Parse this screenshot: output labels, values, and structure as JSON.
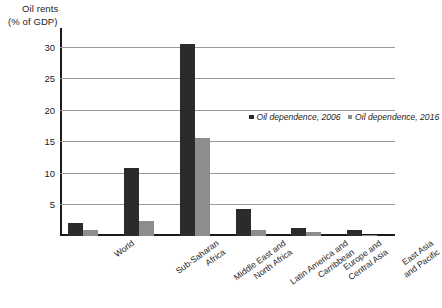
{
  "chart_data": {
    "type": "bar",
    "title": "Oil rents (% of GDP)",
    "title_line1": "Oil rents",
    "title_line2": "(% of GDP)",
    "xlabel": "",
    "ylabel": "Oil rents (% of GDP)",
    "ylim": [
      0,
      33
    ],
    "yticks": [
      5,
      10,
      15,
      20,
      25,
      30
    ],
    "ytick_labels": [
      "5",
      "10",
      "15",
      "20",
      "25",
      "30"
    ],
    "grid": true,
    "grid_axis": "y",
    "legend_position": "upper-center",
    "categories": [
      "World",
      "Sub-Saharan Africa",
      "Middle East and North Africa",
      "Latin America and Carribbean",
      "Europe and Central Asia",
      "East Asia and Pacific"
    ],
    "category_lines": [
      [
        "World"
      ],
      [
        "Sub-Saharan",
        "Africa"
      ],
      [
        "Middle East and",
        "North Africa"
      ],
      [
        "Latin America and",
        "Carribbean"
      ],
      [
        "Europe and",
        "Central Asia"
      ],
      [
        "East Asia",
        "and Pacific"
      ]
    ],
    "series": [
      {
        "name": "Oil dependence, 2006",
        "color": "#2b2b2b",
        "values": [
          2.0,
          10.8,
          30.5,
          4.3,
          1.3,
          1.0
        ]
      },
      {
        "name": "Oil dependence, 2016",
        "color": "#8d8d8d",
        "values": [
          0.9,
          2.4,
          15.5,
          0.9,
          0.7,
          0.2
        ]
      }
    ]
  },
  "legend": {
    "entries": [
      {
        "label": "Oil dependence, 2006"
      },
      {
        "label": "Oil dependence, 2016"
      }
    ]
  },
  "colors": {
    "series_2006": "#2b2b2b",
    "series_2016": "#8d8d8d",
    "axis": "#1a1a1a",
    "gridline": "#9a9a9a",
    "background": "#ffffff",
    "text": "#1d1d1d"
  }
}
